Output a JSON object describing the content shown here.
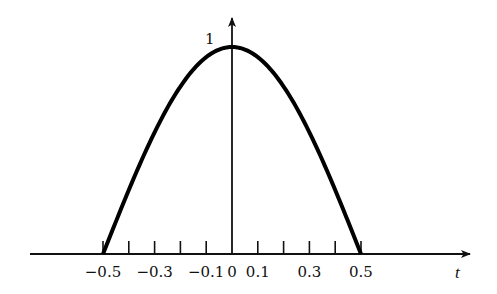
{
  "chart_data": {
    "type": "line",
    "title": "",
    "xlabel": "t",
    "ylabel": "",
    "function": "cos(pi t) for |t| <= 0.5",
    "x": [
      -0.5,
      -0.4,
      -0.3,
      -0.2,
      -0.1,
      0,
      0.1,
      0.2,
      0.3,
      0.4,
      0.5
    ],
    "series": [
      {
        "name": "pulse",
        "values": [
          0,
          0.309,
          0.588,
          0.809,
          0.951,
          1,
          0.951,
          0.809,
          0.588,
          0.309,
          0
        ]
      }
    ],
    "x_ticks": [
      -0.5,
      -0.4,
      -0.3,
      -0.2,
      -0.1,
      0,
      0.1,
      0.2,
      0.3,
      0.4,
      0.5
    ],
    "x_tick_labels": [
      {
        "value": -0.5,
        "label": "−0.5"
      },
      {
        "value": -0.3,
        "label": "−0.3"
      },
      {
        "value": -0.1,
        "label": "−0.1"
      },
      {
        "value": 0,
        "label": "0"
      },
      {
        "value": 0.1,
        "label": "0.1"
      },
      {
        "value": 0.3,
        "label": "0.3"
      },
      {
        "value": 0.5,
        "label": "0.5"
      }
    ],
    "y_tick_labels": [
      {
        "value": 1,
        "label": "1"
      }
    ],
    "grid": false,
    "legend": null,
    "color": "#000000"
  }
}
